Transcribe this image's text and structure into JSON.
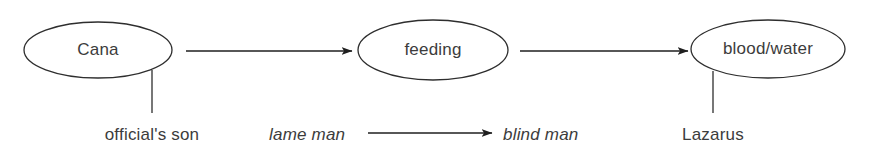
{
  "diagram": {
    "type": "flow-diagram",
    "canvas": {
      "width": 869,
      "height": 153,
      "background": "#ffffff"
    },
    "stroke_color": "#2e2e2e",
    "text_color": "#3c3c3c",
    "nodes": [
      {
        "id": "cana",
        "label": "Cana",
        "shape": "ellipse",
        "cx": 98,
        "cy": 50,
        "rx": 74,
        "ry": 28
      },
      {
        "id": "feeding",
        "label": "feeding",
        "shape": "ellipse",
        "cx": 433,
        "cy": 50,
        "rx": 75,
        "ry": 30
      },
      {
        "id": "blood-water",
        "label": "blood/water",
        "shape": "ellipse",
        "cx": 768,
        "cy": 49,
        "rx": 77,
        "ry": 29
      }
    ],
    "arrows": [
      {
        "id": "cana-to-feeding",
        "from": "cana",
        "to": "feeding",
        "x1": 186,
        "x2": 352,
        "y": 51
      },
      {
        "id": "feeding-to-blood-water",
        "from": "feeding",
        "to": "blood-water",
        "x1": 520,
        "x2": 688,
        "y": 51
      },
      {
        "id": "lame-man-to-blind-man",
        "from": "lame man",
        "to": "blind man",
        "x1": 368,
        "x2": 492,
        "y": 133
      }
    ],
    "connectors": [
      {
        "id": "cana-to-officials-son",
        "x": 152,
        "y1": 70,
        "y2": 113
      },
      {
        "id": "blood-water-to-lazarus",
        "x": 713,
        "y1": 71,
        "y2": 113
      }
    ],
    "captions": [
      {
        "id": "officials-son",
        "label": "official's son",
        "italic": false,
        "x": 152,
        "y": 140,
        "anchor": "middle"
      },
      {
        "id": "lame-man",
        "label": "lame man",
        "italic": true,
        "x": 269,
        "y": 140,
        "anchor": "start"
      },
      {
        "id": "blind-man",
        "label": "blind man",
        "italic": true,
        "x": 503,
        "y": 140,
        "anchor": "start"
      },
      {
        "id": "lazarus",
        "label": "Lazarus",
        "italic": false,
        "x": 713,
        "y": 140,
        "anchor": "middle"
      }
    ]
  }
}
